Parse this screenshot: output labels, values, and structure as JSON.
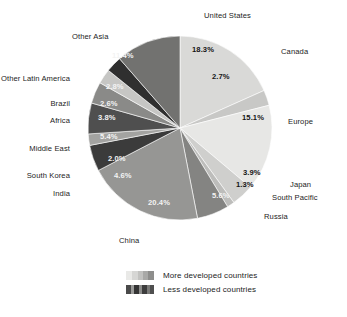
{
  "chart_data": {
    "type": "pie",
    "title": "",
    "subtitle": "",
    "xlabel": "",
    "ylabel": "",
    "units": "percent",
    "start_angle_deg": 0,
    "direction": "clockwise",
    "categories": [
      "United States",
      "Canada",
      "Europe",
      "Japan",
      "South Pacific",
      "Russia",
      "China",
      "India",
      "South Korea",
      "Middle East",
      "Africa",
      "Brazil",
      "Other Latin America",
      "Other Asia"
    ],
    "values": [
      18.3,
      2.7,
      15.1,
      3.9,
      1.3,
      5.6,
      20.4,
      4.6,
      2.0,
      5.4,
      3.8,
      2.6,
      2.8,
      11.4
    ],
    "slices": [
      {
        "label": "United States",
        "value": 18.3,
        "display": "18.3%",
        "color": "#d9d9d7",
        "group": "More developed countries",
        "label_fill": "dark"
      },
      {
        "label": "Canada",
        "value": 2.7,
        "display": "2.7%",
        "color": "#c8c8c6",
        "group": "More developed countries",
        "label_fill": "dark"
      },
      {
        "label": "Europe",
        "value": 15.1,
        "display": "15.1%",
        "color": "#e7e7e5",
        "group": "More developed countries",
        "label_fill": "dark"
      },
      {
        "label": "Japan",
        "value": 3.9,
        "display": "3.9%",
        "color": "#cfcfcd",
        "group": "More developed countries",
        "label_fill": "dark"
      },
      {
        "label": "South Pacific",
        "value": 1.3,
        "display": "1.3%",
        "color": "#bdbdbb",
        "group": "More developed countries",
        "label_fill": "dark"
      },
      {
        "label": "Russia",
        "value": 5.6,
        "display": "5.6%",
        "color": "#848482",
        "group": "More developed countries",
        "label_fill": "light"
      },
      {
        "label": "China",
        "value": 20.4,
        "display": "20.4%",
        "color": "#969694",
        "group": "Less developed countries",
        "label_fill": "light"
      },
      {
        "label": "India",
        "value": 4.6,
        "display": "4.6%",
        "color": "#3b3b3b",
        "group": "Less developed countries",
        "label_fill": "light"
      },
      {
        "label": "South Korea",
        "value": 2.0,
        "display": "2.0%",
        "color": "#a3a3a1",
        "group": "Less developed countries",
        "label_fill": "light"
      },
      {
        "label": "Middle East",
        "value": 5.4,
        "display": "5.4%",
        "color": "#4f4f4f",
        "group": "Less developed countries",
        "label_fill": "light"
      },
      {
        "label": "Africa",
        "value": 3.8,
        "display": "3.8%",
        "color": "#8a8a88",
        "group": "Less developed countries",
        "label_fill": "light"
      },
      {
        "label": "Brazil",
        "value": 2.6,
        "display": "2.6%",
        "color": "#c6c6c4",
        "group": "Less developed countries",
        "label_fill": "light"
      },
      {
        "label": "Other Latin America",
        "value": 2.8,
        "display": "2.8%",
        "color": "#2f2f2f",
        "group": "Less developed countries",
        "label_fill": "light"
      },
      {
        "label": "Other Asia",
        "value": 11.4,
        "display": "11.4%",
        "color": "#727270",
        "group": "Less developed countries",
        "label_fill": "light"
      }
    ],
    "legend": {
      "position": "bottom",
      "entries": [
        {
          "label": "More developed countries",
          "swatch": "more-developed-gradient"
        },
        {
          "label": "Less developed countries",
          "swatch": "less-developed-gradient"
        }
      ]
    },
    "geometry": {
      "cx": 180,
      "cy": 128,
      "r": 92
    },
    "grid": false
  },
  "category_labels": [
    {
      "text": "United States",
      "x": 204,
      "y": 12,
      "anchor": "start"
    },
    {
      "text": "Canada",
      "x": 281,
      "y": 48,
      "anchor": "start"
    },
    {
      "text": "Europe",
      "x": 288,
      "y": 118,
      "anchor": "start"
    },
    {
      "text": "Japan",
      "x": 290,
      "y": 181,
      "anchor": "start"
    },
    {
      "text": "South Pacific",
      "x": 272,
      "y": 194,
      "anchor": "start"
    },
    {
      "text": "Russia",
      "x": 264,
      "y": 213,
      "anchor": "start"
    },
    {
      "text": "China",
      "x": 119,
      "y": 237,
      "anchor": "start"
    },
    {
      "text": "India",
      "x": 70,
      "y": 190,
      "anchor": "end"
    },
    {
      "text": "South Korea",
      "x": 70,
      "y": 172,
      "anchor": "end"
    },
    {
      "text": "Middle East",
      "x": 70,
      "y": 145,
      "anchor": "end"
    },
    {
      "text": "Africa",
      "x": 70,
      "y": 117,
      "anchor": "end"
    },
    {
      "text": "Brazil",
      "x": 70,
      "y": 100,
      "anchor": "end"
    },
    {
      "text": "Other Latin America",
      "x": 70,
      "y": 75,
      "anchor": "end"
    },
    {
      "text": "Other Asia",
      "x": 72,
      "y": 33,
      "anchor": "start"
    }
  ],
  "percent_labels": [
    {
      "text": "18.3%",
      "x": 192,
      "y": 46,
      "fill": "dark"
    },
    {
      "text": "2.7%",
      "x": 212,
      "y": 73,
      "fill": "dark"
    },
    {
      "text": "15.1%",
      "x": 242,
      "y": 114,
      "fill": "dark"
    },
    {
      "text": "3.9%",
      "x": 243,
      "y": 169,
      "fill": "dark"
    },
    {
      "text": "1.3%",
      "x": 236,
      "y": 181,
      "fill": "dark"
    },
    {
      "text": "5.6%",
      "x": 212,
      "y": 192,
      "fill": "light"
    },
    {
      "text": "20.4%",
      "x": 148,
      "y": 199,
      "fill": "light"
    },
    {
      "text": "4.6%",
      "x": 114,
      "y": 172,
      "fill": "light"
    },
    {
      "text": "2.0%",
      "x": 108,
      "y": 155,
      "fill": "light"
    },
    {
      "text": "5.4%",
      "x": 100,
      "y": 133,
      "fill": "light"
    },
    {
      "text": "3.8%",
      "x": 98,
      "y": 114,
      "fill": "light"
    },
    {
      "text": "2.6%",
      "x": 100,
      "y": 100,
      "fill": "light"
    },
    {
      "text": "2.8%",
      "x": 106,
      "y": 83,
      "fill": "light"
    },
    {
      "text": "11.4%",
      "x": 112,
      "y": 52,
      "fill": "light"
    }
  ]
}
